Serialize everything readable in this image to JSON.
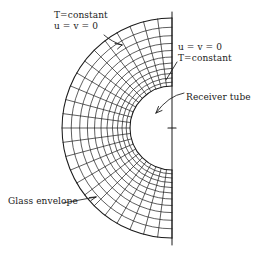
{
  "figure": {
    "background_color": "#ffffff",
    "line_color": "#1a1a1a"
  },
  "labels": {
    "bc_outer": {
      "line1": "T=constant",
      "line2": "u = v = 0"
    },
    "bc_inner": {
      "line1": "u = v = 0",
      "line2": "T=constant"
    },
    "receiver_tube": "Receiver tube",
    "glass_envelope": "Glass envelope"
  },
  "chart_data": {
    "type": "diagram",
    "geometry": {
      "center_x": 172,
      "center_y": 128,
      "inner_radius": 42,
      "outer_radius": 110,
      "angle_start_deg": 90,
      "angle_end_deg": 270,
      "radial_divisions": 11,
      "angular_divisions": 24,
      "symmetry_axis_x": 172,
      "symmetry_axis_y_top": 12,
      "symmetry_axis_y_bottom": 245,
      "center_tick_half_width": 4
    },
    "components": [
      {
        "name": "receiver-tube",
        "role": "inner boundary",
        "shape": "circle arc",
        "radius": 42,
        "boundary_conditions": [
          "u = v = 0",
          "T=constant"
        ]
      },
      {
        "name": "glass-envelope",
        "role": "outer boundary",
        "shape": "circle arc",
        "radius": 110,
        "boundary_conditions": [
          "T=constant",
          "u = v = 0"
        ]
      }
    ],
    "annotations": [
      {
        "text": "T=constant",
        "target": "glass-envelope",
        "position": "top-left"
      },
      {
        "text": "u = v = 0",
        "target": "glass-envelope",
        "position": "top-left"
      },
      {
        "text": "u = v = 0",
        "target": "receiver-tube",
        "position": "right"
      },
      {
        "text": "T=constant",
        "target": "receiver-tube",
        "position": "right"
      },
      {
        "text": "Receiver tube",
        "target": "receiver-tube",
        "position": "right"
      },
      {
        "text": "Glass envelope",
        "target": "glass-envelope",
        "position": "bottom-left"
      }
    ]
  }
}
